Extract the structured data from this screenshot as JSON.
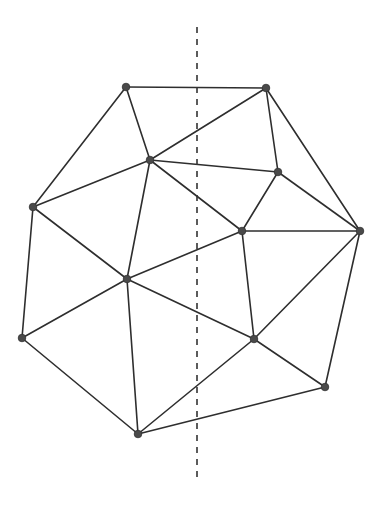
{
  "diagram": {
    "type": "planar-triangulation",
    "width": 383,
    "height": 508,
    "colors": {
      "edge": "#2e2e2e",
      "vertex": "#4a4a4a",
      "cut_line": "#333333",
      "background": "#ffffff"
    },
    "vertices": [
      {
        "id": "A",
        "x": 126,
        "y": 87
      },
      {
        "id": "B",
        "x": 266,
        "y": 88
      },
      {
        "id": "C",
        "x": 150,
        "y": 160
      },
      {
        "id": "D",
        "x": 278,
        "y": 172
      },
      {
        "id": "E",
        "x": 33,
        "y": 207
      },
      {
        "id": "F",
        "x": 242,
        "y": 231
      },
      {
        "id": "G",
        "x": 360,
        "y": 231
      },
      {
        "id": "H",
        "x": 127,
        "y": 279
      },
      {
        "id": "I",
        "x": 22,
        "y": 338
      },
      {
        "id": "J",
        "x": 254,
        "y": 339
      },
      {
        "id": "K",
        "x": 325,
        "y": 387
      },
      {
        "id": "L",
        "x": 138,
        "y": 434
      }
    ],
    "edges": [
      [
        "A",
        "B"
      ],
      [
        "A",
        "C"
      ],
      [
        "A",
        "E"
      ],
      [
        "B",
        "C"
      ],
      [
        "B",
        "D"
      ],
      [
        "B",
        "G"
      ],
      [
        "C",
        "D"
      ],
      [
        "C",
        "E"
      ],
      [
        "C",
        "F"
      ],
      [
        "C",
        "H"
      ],
      [
        "D",
        "F"
      ],
      [
        "D",
        "G"
      ],
      [
        "E",
        "H"
      ],
      [
        "E",
        "I"
      ],
      [
        "F",
        "G"
      ],
      [
        "F",
        "H"
      ],
      [
        "F",
        "J"
      ],
      [
        "G",
        "J"
      ],
      [
        "G",
        "K"
      ],
      [
        "H",
        "I"
      ],
      [
        "H",
        "J"
      ],
      [
        "H",
        "L"
      ],
      [
        "I",
        "L"
      ],
      [
        "J",
        "K"
      ],
      [
        "J",
        "L"
      ],
      [
        "K",
        "L"
      ]
    ],
    "cut_line": {
      "x": 197,
      "y1": 27,
      "y2": 483,
      "style": "dashed"
    }
  }
}
